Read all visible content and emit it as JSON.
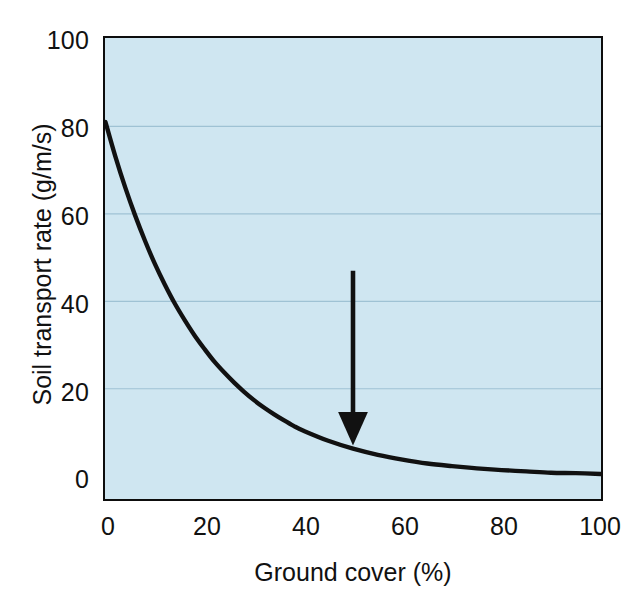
{
  "chart_data": {
    "type": "line",
    "title": "",
    "subtitle": "",
    "xlabel": "Ground cover (%)",
    "ylabel": "Soil transport rate (g/m/s)",
    "xlim": [
      0,
      100
    ],
    "ylim": [
      0,
      100
    ],
    "xticks": [
      "0",
      "20",
      "40",
      "60",
      "80",
      "100"
    ],
    "xtick_values": [
      0,
      20,
      40,
      60,
      80,
      100
    ],
    "yticks": [
      "0",
      "20",
      "40",
      "60",
      "80",
      "100"
    ],
    "ytick_values": [
      0,
      20,
      40,
      60,
      80,
      100
    ],
    "grid": "horizontal",
    "gridlines_at": [
      20,
      40,
      60,
      80
    ],
    "legend": null,
    "legend_position": "none",
    "plot_background": "#cfe6f1",
    "series": [
      {
        "name": "Soil transport rate",
        "color": "#111111",
        "x": [
          0,
          2,
          4,
          6,
          8,
          10,
          12,
          14,
          16,
          18,
          20,
          22,
          24,
          26,
          28,
          30,
          32,
          34,
          36,
          38,
          40,
          45,
          50,
          55,
          60,
          65,
          70,
          75,
          80,
          85,
          90,
          95,
          100
        ],
        "values": [
          81.0,
          73.1,
          66.0,
          59.6,
          53.8,
          48.5,
          43.8,
          39.5,
          35.7,
          32.2,
          29.1,
          26.2,
          23.7,
          21.4,
          19.3,
          17.4,
          15.7,
          14.2,
          12.8,
          11.5,
          10.4,
          8.1,
          6.3,
          4.9,
          3.8,
          2.9,
          2.3,
          1.8,
          1.4,
          1.1,
          0.8,
          0.7,
          0.5
        ]
      }
    ],
    "annotations": [
      {
        "name": "downward-arrow",
        "type": "arrow",
        "x": 50,
        "y_start": 47,
        "y_end": 7,
        "color": "#111111"
      }
    ]
  },
  "axes": {
    "y_tick_labels": [
      "100",
      "80",
      "60",
      "40",
      "20",
      "0"
    ],
    "x_tick_labels": [
      "0",
      "20",
      "40",
      "60",
      "80",
      "100"
    ],
    "y_axis_title": "Soil transport rate (g/m/s)",
    "x_axis_title": "Ground cover (%)"
  },
  "colors": {
    "plot_fill": "#cfe6f1",
    "axis": "#0d0d0d",
    "curve": "#111111",
    "gridline": "#9fc2d4",
    "page": "#ffffff"
  }
}
